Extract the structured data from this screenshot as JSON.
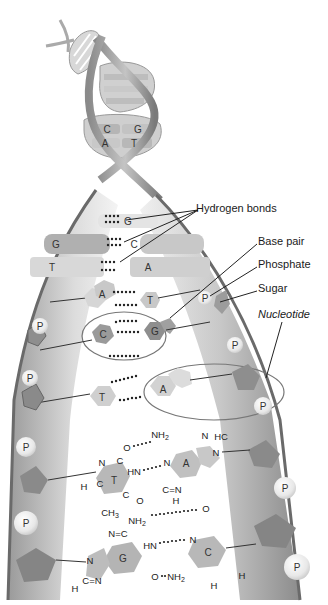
{
  "diagram": {
    "type": "DNA double helix structure",
    "labels": {
      "hydrogen_bonds": "Hydrogen bonds",
      "base_pair": "Base pair",
      "phosphate": "Phosphate",
      "sugar": "Sugar",
      "nucleotide": "Nucleotide"
    },
    "helix_pairs": [
      {
        "left": "C",
        "right": "G"
      },
      {
        "left": "A",
        "right": "T"
      }
    ],
    "ladder_pairs": [
      {
        "left": "",
        "right": "G"
      },
      {
        "left": "G",
        "right": "C"
      },
      {
        "left": "T",
        "right": "A"
      },
      {
        "left": "A",
        "right": "T"
      },
      {
        "left": "C",
        "right": "G"
      },
      {
        "left": "T",
        "right": "A"
      }
    ],
    "phosphate_symbol": "P",
    "chemical_pairs": [
      {
        "left_base": "T",
        "right_base": "A",
        "atoms": {
          "o_top": "O",
          "nh2": "NH2",
          "n_hc": "N",
          "hc": "HC",
          "n1": "N",
          "c1": "C",
          "hn": "HN",
          "n_a": "N",
          "c_a": "C",
          "n_a2": "N",
          "h_left": "H",
          "c2": "C",
          "c3": "C",
          "o_bot": "O",
          "ch3": "CH3",
          "h_bot": "H",
          "c_eq_n": "C=N"
        }
      },
      {
        "left_base": "G",
        "right_base": "C",
        "atoms": {
          "nh2_top": "NH2",
          "o_top": "O",
          "n_eq_c": "N=C",
          "hn": "HN",
          "n_c": "N",
          "c_c": "C",
          "n_g": "N",
          "c_g": "C",
          "h_c": "H",
          "h_g": "H",
          "o_g": "O",
          "nh2_bot": "NH2",
          "c_eq_n": "C=N",
          "h_cbot": "H"
        }
      }
    ]
  }
}
